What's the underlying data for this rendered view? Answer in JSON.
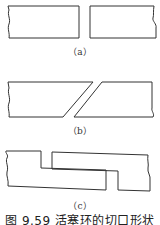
{
  "figure": {
    "caption": "图 9.59  活塞环的切口形状",
    "stroke_color": "#333333",
    "panels": [
      {
        "id": "a",
        "label": "（a）",
        "description": "straight-cut gap"
      },
      {
        "id": "b",
        "label": "（b）",
        "description": "angle-cut gap"
      },
      {
        "id": "c",
        "label": "（c）",
        "description": "step-cut gap"
      }
    ]
  }
}
